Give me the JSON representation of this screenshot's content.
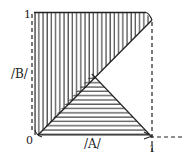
{
  "diagram": {
    "labels": {
      "top_left_one": "1",
      "y_axis": "/B/",
      "origin": "0",
      "x_axis": "/A/",
      "bottom_right_one": "1"
    },
    "regions": [
      {
        "name": "upper-left triangle",
        "hatch": "vertical"
      },
      {
        "name": "lower triangle",
        "hatch": "horizontal"
      }
    ],
    "colors": {
      "ink": "#222222",
      "background": "#ffffff"
    }
  }
}
